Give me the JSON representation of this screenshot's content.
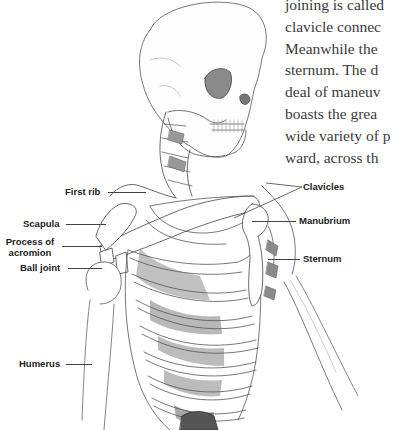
{
  "body_text": {
    "lines": [
      "joining is called",
      "clavicle connec",
      "Meanwhile the",
      "sternum. The d",
      "deal of maneuv",
      "boasts the grea",
      "wide variety of p",
      "ward, across th"
    ]
  },
  "figure": {
    "labels": {
      "first_rib": "First rib",
      "scapula": "Scapula",
      "process_of_acromion_1": "Process of",
      "process_of_acromion_2": "acromion",
      "ball_joint": "Ball joint",
      "humerus": "Humerus",
      "clavicles": "Clavicles",
      "manubrium": "Manubrium",
      "sternum": "Sternum"
    }
  }
}
